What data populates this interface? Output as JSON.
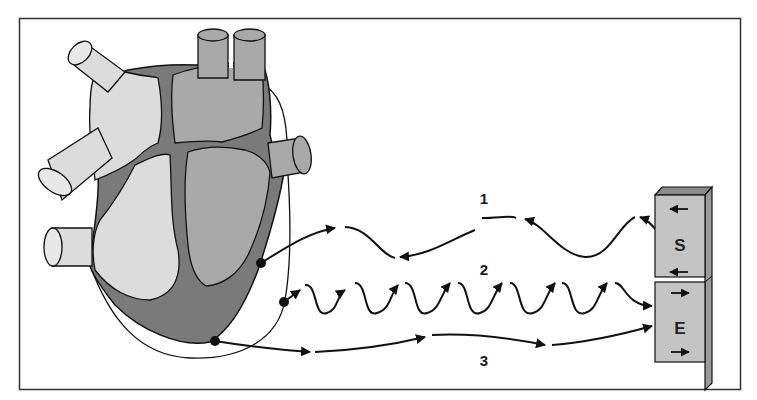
{
  "diagram": {
    "colors": {
      "background": "#ffffff",
      "frame": "#333333",
      "dark_tissue": "#7a7a7a",
      "medium_chamber": "#a9a9a9",
      "light_chamber": "#dcdcdc",
      "outline": "#111111",
      "device_face": "#c4c4c4",
      "device_side": "#9a9a9a",
      "device_top": "#8a8a8a"
    },
    "paths": [
      {
        "label": "1",
        "description": "slow wave from S block to upper electrode",
        "direction": "device-to-heart"
      },
      {
        "label": "2",
        "description": "rapid oscillating wave from middle electrode to E block",
        "direction": "heart-to-device"
      },
      {
        "label": "3",
        "description": "nearly straight line from apex electrode to E block",
        "direction": "heart-to-device"
      }
    ],
    "device": {
      "blocks": [
        {
          "letter": "S",
          "arrows": [
            "left",
            "left"
          ]
        },
        {
          "letter": "E",
          "arrows": [
            "right",
            "right"
          ]
        }
      ]
    }
  }
}
